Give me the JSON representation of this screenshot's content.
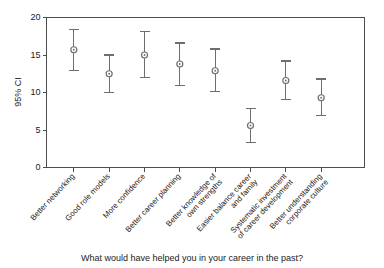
{
  "chart_data": {
    "type": "scatter",
    "title": "",
    "subtitle": "",
    "xlabel": "What would have helped you in your career in the past?",
    "ylabel": "95% CI",
    "ylim": [
      0,
      20
    ],
    "yticks": [
      0,
      5,
      10,
      15,
      20
    ],
    "ytick_labels": [
      "0",
      "5",
      "10",
      "15",
      "20"
    ],
    "grid": false,
    "legend": false,
    "legend_position": "none",
    "error_bars": "95% confidence interval",
    "categories": [
      "Better networking",
      "Good role models",
      "More confidence",
      "Better career planning",
      "Better knowledge of\nown strengths",
      "Easier balance career\nand family",
      "Systematic investment\nof career development",
      "Better understanding\ncorporate culture"
    ],
    "category_lines": [
      [
        "Better networking"
      ],
      [
        "Good role models"
      ],
      [
        "More confidence"
      ],
      [
        "Better career planning"
      ],
      [
        "Better knowledge of",
        "own strengths"
      ],
      [
        "Easier balance career",
        "and family"
      ],
      [
        "Systematic investment",
        "of career development"
      ],
      [
        "Better understanding",
        "corporate culture"
      ]
    ],
    "values": [
      15.7,
      12.5,
      15.0,
      13.8,
      12.9,
      5.6,
      11.6,
      9.3
    ],
    "ci_lower": [
      12.9,
      10.0,
      12.0,
      10.9,
      10.1,
      3.3,
      9.1,
      6.9
    ],
    "ci_upper": [
      18.4,
      15.0,
      18.1,
      16.6,
      15.8,
      7.9,
      14.2,
      11.8
    ],
    "marker": "circle-open-with-dot",
    "series": [
      {
        "name": "95% CI",
        "values": [
          15.7,
          12.5,
          15.0,
          13.8,
          12.9,
          5.6,
          11.6,
          9.3
        ],
        "lower": [
          12.9,
          10.0,
          12.0,
          10.9,
          10.1,
          3.3,
          9.1,
          6.9
        ],
        "upper": [
          18.4,
          15.0,
          18.1,
          16.6,
          15.8,
          7.9,
          14.2,
          11.8
        ]
      }
    ],
    "colors": {
      "marker": "#6e6e6e",
      "errorbar": "#6e6e6e",
      "axis": "#4d4d4d",
      "text": "#1a1a1a",
      "background": "#ffffff"
    }
  }
}
